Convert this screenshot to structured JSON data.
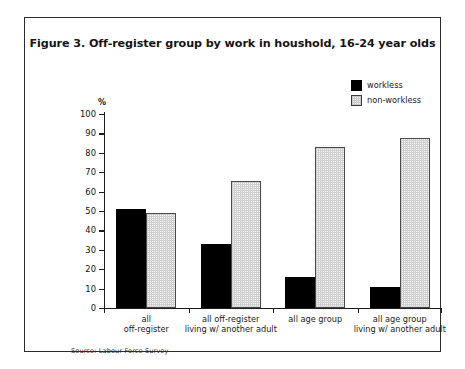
{
  "figure": {
    "title": "Figure 3. Off-register group by work in houshold, 16-24 year olds",
    "source_note": "Source: Labour Force Survey"
  },
  "chart_data": {
    "type": "bar",
    "title": "Figure 3. Off-register group by work in houshold, 16-24 year olds",
    "xlabel": "",
    "ylabel": "%",
    "ylim": [
      0,
      100
    ],
    "yticks": [
      0,
      10,
      20,
      30,
      40,
      50,
      60,
      70,
      80,
      90,
      100
    ],
    "ytick_labels": [
      "0",
      "10",
      "20",
      "30",
      "40",
      "50",
      "60",
      "70",
      "80",
      "90",
      "100"
    ],
    "grid": false,
    "legend_position": "top-right",
    "categories": [
      "all off-register",
      "all off-register living w/ another adult",
      "all age group",
      "all age group living w/ another adult"
    ],
    "category_lines": [
      [
        "all",
        "off-register"
      ],
      [
        "all off-register",
        "living w/ another adult"
      ],
      [
        "all age group",
        ""
      ],
      [
        "all age group",
        "living w/ another adult"
      ]
    ],
    "series": [
      {
        "name": "workless",
        "color": "#000000",
        "values": [
          51,
          33,
          16,
          11
        ]
      },
      {
        "name": "non-workless",
        "color": "#f0f0f0",
        "values": [
          49,
          65.5,
          83,
          87.5
        ]
      }
    ]
  },
  "legend": {
    "items": [
      {
        "label": "workless",
        "swatch": "solid-black-swatch"
      },
      {
        "label": "non-workless",
        "swatch": "stippled-swatch"
      }
    ]
  }
}
